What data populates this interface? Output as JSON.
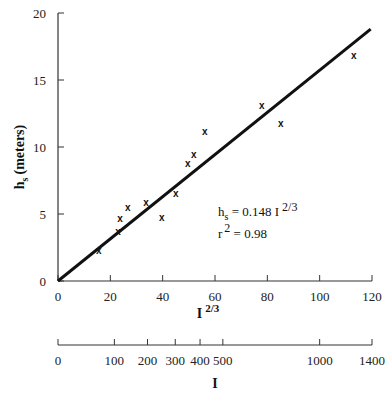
{
  "chart_data": {
    "type": "scatter",
    "title": "",
    "xlabel": "I",
    "xlabel_superscript": "2/3",
    "ylabel": "h",
    "ylabel_subscript": "s",
    "ylabel_suffix": "(meters)",
    "xlim": [
      0,
      120
    ],
    "ylim": [
      0,
      20
    ],
    "grid": false,
    "x_ticks": [
      0,
      20,
      40,
      60,
      80,
      100,
      120
    ],
    "y_ticks": [
      0,
      5,
      10,
      15,
      20
    ],
    "marker": "x",
    "series": [
      {
        "name": "observations",
        "points": [
          {
            "x": 15.6,
            "y": 2.3
          },
          {
            "x": 22.9,
            "y": 3.7
          },
          {
            "x": 23.7,
            "y": 4.7
          },
          {
            "x": 26.7,
            "y": 5.5
          },
          {
            "x": 33.6,
            "y": 5.9
          },
          {
            "x": 39.7,
            "y": 4.8
          },
          {
            "x": 45.0,
            "y": 6.6
          },
          {
            "x": 49.6,
            "y": 8.8
          },
          {
            "x": 51.9,
            "y": 9.5
          },
          {
            "x": 56.1,
            "y": 11.2
          },
          {
            "x": 77.9,
            "y": 13.1
          },
          {
            "x": 85.1,
            "y": 11.8
          },
          {
            "x": 113.0,
            "y": 16.9
          }
        ]
      }
    ],
    "fit_line": {
      "x": [
        0,
        119.5
      ],
      "y": [
        0,
        18.8
      ],
      "equation": "h_s = 0.148 I^(2/3)"
    },
    "annotations": {
      "equation_main": "h",
      "equation_sub": "s",
      "equation_rest": " = 0.148 I",
      "equation_sup": "2/3",
      "r2_main": "r",
      "r2_sup": "2",
      "r2_rest": " = 0.98"
    },
    "secondary_axis": {
      "label": "I",
      "ticks": [
        0,
        100,
        200,
        300,
        400,
        500,
        1000,
        1400
      ],
      "tick_positions_on_primary": [
        0,
        21.54,
        34.2,
        44.81,
        54.29,
        63.0,
        100.0,
        125.2
      ]
    }
  }
}
